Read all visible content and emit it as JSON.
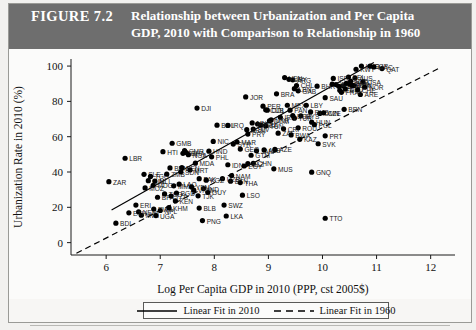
{
  "figure": {
    "label": "FIGURE 7.2",
    "title_line1": "Relationship between Urbanization and Per Capita",
    "title_line2": "GDP, 2010 with Comparison to Relationship in 1960"
  },
  "legend": {
    "position": "bottom-center",
    "entries": [
      {
        "label": "Linear Fit in 2010",
        "style": "solid",
        "color": "#000000"
      },
      {
        "label": "Linear Fit in 1960",
        "style": "dashed",
        "color": "#000000"
      }
    ]
  },
  "chart_data": {
    "type": "scatter",
    "title": "Relationship between Urbanization and Per Capita GDP, 2010 with Comparison to Relationship in 1960",
    "xlabel": "Log Per Capita GDP in 2010 (PPP, cst 2005$)",
    "ylabel": "Urbanization Rate in 2010 (%)",
    "xlim": [
      5.35,
      12.45
    ],
    "ylim": [
      -7,
      104
    ],
    "xticks": [
      6,
      7,
      8,
      9,
      10,
      11,
      12
    ],
    "yticks": [
      0,
      20,
      40,
      60,
      80,
      100
    ],
    "grid": false,
    "point_color": "#000000",
    "point_label_color": "#1a1a1a",
    "series": [
      {
        "name": "Countries 2010",
        "points": [
          {
            "label": "BDI",
            "x": 6.18,
            "y": 11.0
          },
          {
            "label": "ZAR",
            "x": 6.05,
            "y": 34.5
          },
          {
            "label": "LBR",
            "x": 6.35,
            "y": 47.8
          },
          {
            "label": "ERI",
            "x": 6.55,
            "y": 21.3
          },
          {
            "label": "NER",
            "x": 6.6,
            "y": 17.4
          },
          {
            "label": "MWI",
            "x": 6.65,
            "y": 15.5
          },
          {
            "label": "ETH",
            "x": 6.42,
            "y": 16.9
          },
          {
            "label": "SLE",
            "x": 6.7,
            "y": 38.7
          },
          {
            "label": "GIN",
            "x": 6.78,
            "y": 35.1
          },
          {
            "label": "MOZ",
            "x": 6.72,
            "y": 31.0
          },
          {
            "label": "TGO",
            "x": 6.82,
            "y": 37.5
          },
          {
            "label": "MLI",
            "x": 6.9,
            "y": 34.9
          },
          {
            "label": "RWA",
            "x": 6.88,
            "y": 19.0
          },
          {
            "label": "UGA",
            "x": 6.92,
            "y": 15.3
          },
          {
            "label": "BFA",
            "x": 6.95,
            "y": 25.7
          },
          {
            "label": "MDG",
            "x": 6.87,
            "y": 32.5
          },
          {
            "label": "NPL",
            "x": 7.0,
            "y": 18.2
          },
          {
            "label": "HTI",
            "x": 7.05,
            "y": 51.5
          },
          {
            "label": "GMB",
            "x": 7.22,
            "y": 56.3
          },
          {
            "label": "BEN",
            "x": 7.18,
            "y": 42.3
          },
          {
            "label": "ZMB",
            "x": 7.12,
            "y": 38.8
          },
          {
            "label": "TCD",
            "x": 7.08,
            "y": 27.6
          },
          {
            "label": "MMR",
            "x": 7.25,
            "y": 32.2
          },
          {
            "label": "KHM",
            "x": 7.16,
            "y": 19.8
          },
          {
            "label": "BGD",
            "x": 7.3,
            "y": 28.1
          },
          {
            "label": "TZA",
            "x": 7.2,
            "y": 26.4
          },
          {
            "label": "KEN",
            "x": 7.28,
            "y": 23.6
          },
          {
            "label": "LAO",
            "x": 7.35,
            "y": 33.1
          },
          {
            "label": "SEN",
            "x": 7.4,
            "y": 42.5
          },
          {
            "label": "MRT",
            "x": 7.55,
            "y": 41.2
          },
          {
            "label": "CMR",
            "x": 7.45,
            "y": 52.1
          },
          {
            "label": "CIV",
            "x": 7.42,
            "y": 50.6
          },
          {
            "label": "NGA",
            "x": 7.52,
            "y": 49.8
          },
          {
            "label": "GHA",
            "x": 7.48,
            "y": 51.0
          },
          {
            "label": "SDN",
            "x": 7.38,
            "y": 40.1
          },
          {
            "label": "PAK",
            "x": 7.72,
            "y": 36.2
          },
          {
            "label": "IND",
            "x": 7.8,
            "y": 30.6
          },
          {
            "label": "VNM",
            "x": 7.62,
            "y": 29.7
          },
          {
            "label": "YEM",
            "x": 7.58,
            "y": 31.5
          },
          {
            "label": "PNG",
            "x": 7.78,
            "y": 12.5
          },
          {
            "label": "BLB",
            "x": 7.72,
            "y": 19.6
          },
          {
            "label": "GUY",
            "x": 7.88,
            "y": 28.4
          },
          {
            "label": "MDA",
            "x": 7.65,
            "y": 45.0
          },
          {
            "label": "PHL",
            "x": 7.95,
            "y": 48.6
          },
          {
            "label": "BOL",
            "x": 8.05,
            "y": 66.5
          },
          {
            "label": "HND",
            "x": 7.9,
            "y": 51.8
          },
          {
            "label": "NIC",
            "x": 7.98,
            "y": 57.3
          },
          {
            "label": "LKA",
            "x": 8.22,
            "y": 15.1
          },
          {
            "label": "SWZ",
            "x": 8.18,
            "y": 21.3
          },
          {
            "label": "BTN",
            "x": 8.3,
            "y": 34.8
          },
          {
            "label": "NAM",
            "x": 8.32,
            "y": 38.0
          },
          {
            "label": "THA",
            "x": 8.48,
            "y": 34.0
          },
          {
            "label": "CHN",
            "x": 8.72,
            "y": 44.9
          },
          {
            "label": "BLZ",
            "x": 8.62,
            "y": 44.8
          },
          {
            "label": "LSO",
            "x": 8.52,
            "y": 26.9
          },
          {
            "label": "JAM",
            "x": 8.78,
            "y": 52.0
          },
          {
            "label": "MUS",
            "x": 9.1,
            "y": 41.8
          },
          {
            "label": "GNQ",
            "x": 9.8,
            "y": 39.9
          },
          {
            "label": "TTO",
            "x": 10.05,
            "y": 13.8
          },
          {
            "label": "IDN",
            "x": 8.25,
            "y": 44.1
          },
          {
            "label": "EGY",
            "x": 8.55,
            "y": 43.4
          },
          {
            "label": "SYR",
            "x": 8.35,
            "y": 55.8
          },
          {
            "label": "MAR",
            "x": 8.42,
            "y": 57.0
          },
          {
            "label": "DZA",
            "x": 8.86,
            "y": 66.5
          },
          {
            "label": "TUN",
            "x": 8.95,
            "y": 66.1
          },
          {
            "label": "PER",
            "x": 8.9,
            "y": 77.3
          },
          {
            "label": "COL",
            "x": 8.98,
            "y": 75.0
          },
          {
            "label": "ECU",
            "x": 8.8,
            "y": 67.2
          },
          {
            "label": "BRA",
            "x": 9.15,
            "y": 84.3
          },
          {
            "label": "ARG",
            "x": 9.45,
            "y": 92.2
          },
          {
            "label": "URY",
            "x": 9.38,
            "y": 92.5
          },
          {
            "label": "CHL",
            "x": 9.52,
            "y": 89.0
          },
          {
            "label": "VEN",
            "x": 9.3,
            "y": 93.5
          },
          {
            "label": "MEX",
            "x": 9.35,
            "y": 77.8
          },
          {
            "label": "TUR",
            "x": 9.48,
            "y": 70.5
          },
          {
            "label": "JOR",
            "x": 8.58,
            "y": 82.5
          },
          {
            "label": "DJI",
            "x": 7.68,
            "y": 76.2
          },
          {
            "label": "IRN",
            "x": 9.22,
            "y": 71.0
          },
          {
            "label": "MYS",
            "x": 9.6,
            "y": 71.8
          },
          {
            "label": "OMN",
            "x": 9.95,
            "y": 73.2
          },
          {
            "label": "BRN",
            "x": 10.4,
            "y": 75.5
          },
          {
            "label": "ARE",
            "x": 10.7,
            "y": 83.9
          },
          {
            "label": "SAU",
            "x": 10.05,
            "y": 82.1
          },
          {
            "label": "BHR",
            "x": 9.9,
            "y": 88.6
          },
          {
            "label": "KWT",
            "x": 10.62,
            "y": 98.2
          },
          {
            "label": "QAT",
            "x": 11.1,
            "y": 98.6
          },
          {
            "label": "HKG",
            "x": 10.72,
            "y": 100.0
          },
          {
            "label": "SGP",
            "x": 10.88,
            "y": 100.0
          },
          {
            "label": "MAC",
            "x": 10.95,
            "y": 99.5
          },
          {
            "label": "JPN",
            "x": 10.38,
            "y": 88.8
          },
          {
            "label": "KOR",
            "x": 10.25,
            "y": 89.5
          },
          {
            "label": "GRC",
            "x": 10.18,
            "y": 89.8
          },
          {
            "label": "ESP",
            "x": 10.3,
            "y": 88.5
          },
          {
            "label": "ITA",
            "x": 10.32,
            "y": 86.3
          },
          {
            "label": "FRA",
            "x": 10.35,
            "y": 85.1
          },
          {
            "label": "DEU",
            "x": 10.42,
            "y": 87.0
          },
          {
            "label": "GBR",
            "x": 10.44,
            "y": 90.2
          },
          {
            "label": "USA",
            "x": 10.75,
            "y": 91.0
          },
          {
            "label": "CAN",
            "x": 10.58,
            "y": 89.0
          },
          {
            "label": "AUS",
            "x": 10.6,
            "y": 93.2
          },
          {
            "label": "NLD",
            "x": 10.52,
            "y": 91.5
          },
          {
            "label": "BEL",
            "x": 10.48,
            "y": 93.8
          },
          {
            "label": "DNK",
            "x": 10.55,
            "y": 89.2
          },
          {
            "label": "SWE",
            "x": 10.5,
            "y": 90.0
          },
          {
            "label": "NOR",
            "x": 10.78,
            "y": 88.0
          },
          {
            "label": "CHE",
            "x": 10.65,
            "y": 86.5
          },
          {
            "label": "ISR",
            "x": 10.2,
            "y": 93.0
          },
          {
            "label": "POL",
            "x": 9.85,
            "y": 66.8
          },
          {
            "label": "RUS",
            "x": 9.78,
            "y": 74.0
          },
          {
            "label": "UKR",
            "x": 9.05,
            "y": 69.5
          },
          {
            "label": "ROU",
            "x": 9.55,
            "y": 65.0
          },
          {
            "label": "BGR",
            "x": 9.45,
            "y": 72.0
          },
          {
            "label": "HUN",
            "x": 9.8,
            "y": 68.2
          },
          {
            "label": "CZE",
            "x": 10.02,
            "y": 73.5
          },
          {
            "label": "SVK",
            "x": 9.92,
            "y": 56.0
          },
          {
            "label": "PRT",
            "x": 10.05,
            "y": 60.5
          },
          {
            "label": "ZAF",
            "x": 9.18,
            "y": 62.0
          },
          {
            "label": "BWA",
            "x": 9.42,
            "y": 61.0
          },
          {
            "label": "GAB",
            "x": 9.55,
            "y": 86.0
          },
          {
            "label": "CRI",
            "x": 9.28,
            "y": 64.5
          },
          {
            "label": "PAN",
            "x": 9.4,
            "y": 75.0
          },
          {
            "label": "DOM",
            "x": 9.02,
            "y": 69.0
          },
          {
            "label": "PRY",
            "x": 8.62,
            "y": 61.5
          },
          {
            "label": "SLV",
            "x": 8.72,
            "y": 64.3
          },
          {
            "label": "GTM",
            "x": 8.68,
            "y": 49.5
          },
          {
            "label": "ALB",
            "x": 8.92,
            "y": 52.5
          },
          {
            "label": "GEO",
            "x": 8.48,
            "y": 53.0
          },
          {
            "label": "ARM",
            "x": 8.6,
            "y": 64.0
          },
          {
            "label": "AZE",
            "x": 9.12,
            "y": 52.8
          },
          {
            "label": "UZB",
            "x": 8.15,
            "y": 36.2
          },
          {
            "label": "KGZ",
            "x": 7.85,
            "y": 35.4
          },
          {
            "label": "TJK",
            "x": 7.7,
            "y": 26.5
          },
          {
            "label": "MNG",
            "x": 8.7,
            "y": 67.8
          },
          {
            "label": "KAZ",
            "x": 9.58,
            "y": 58.5
          },
          {
            "label": "IRQ",
            "x": 8.25,
            "y": 66.4
          },
          {
            "label": "LBY",
            "x": 9.7,
            "y": 77.8
          },
          {
            "label": "LBN",
            "x": 9.48,
            "y": 87.2
          },
          {
            "label": "CUB",
            "x": 8.95,
            "y": 75.2
          }
        ]
      }
    ],
    "fit_lines": [
      {
        "name": "Linear Fit in 2010",
        "style": "solid",
        "x1": 6.1,
        "y1": 18.5,
        "x2": 10.95,
        "y2": 102.0
      },
      {
        "name": "Linear Fit in 1960",
        "style": "dashed",
        "x1": 5.45,
        "y1": -6.0,
        "x2": 12.2,
        "y2": 99.5
      }
    ]
  }
}
